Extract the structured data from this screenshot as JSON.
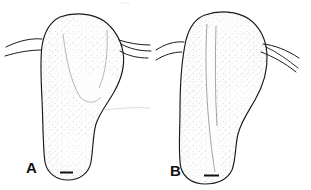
{
  "figure": {
    "type": "scientific-line-drawing",
    "background_color": "#ffffff",
    "ink_color": "#1a1a1a",
    "stipple_color": "#555555",
    "panels": [
      {
        "id": "A",
        "label": "A",
        "label_position": {
          "x": 26,
          "y": 160
        },
        "description": "dorsal outline of club-shaped structure with rounded apical dome, paired lateral projections and narrowed rounded base",
        "scale_bar": {
          "label": "",
          "x": 60,
          "y": 172,
          "length_px": 13,
          "thickness_px": 2
        },
        "outline_points": "see svg",
        "lateral_setae_left": 1,
        "lateral_setae_right": 2
      },
      {
        "id": "B",
        "label": "B",
        "label_position": {
          "x": 170,
          "y": 163
        },
        "description": "dorsal outline of broader club-shaped structure with median longitudinal groove, paired lateral projections and broad rounded base",
        "scale_bar": {
          "label": "",
          "x": 204,
          "y": 175,
          "length_px": 15,
          "thickness_px": 2
        },
        "outline_points": "see svg",
        "lateral_setae_left": 2,
        "lateral_setae_right": 2
      }
    ]
  },
  "canvas": {
    "width": 311,
    "height": 190
  }
}
